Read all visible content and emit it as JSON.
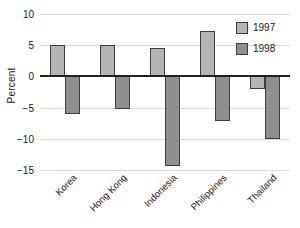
{
  "chart_data": {
    "type": "bar",
    "title": "",
    "xlabel": "",
    "ylabel": "Percent",
    "categories": [
      "Korea",
      "Hong Kong",
      "Indonesia",
      "Philippines",
      "Thailand"
    ],
    "series": [
      {
        "name": "1997",
        "color": "#b4b4b4",
        "values": [
          5.0,
          5.1,
          4.5,
          7.3,
          -2.0
        ]
      },
      {
        "name": "1998",
        "color": "#8f8f8f",
        "values": [
          -6.1,
          -5.2,
          -14.3,
          -7.2,
          -10.0
        ]
      }
    ],
    "ylim": [
      -15,
      10
    ],
    "yticks": [
      10,
      5,
      0,
      -5,
      -10,
      -15
    ],
    "ytick_labels": [
      "10",
      "5",
      "0",
      "−5",
      "−10",
      "−15"
    ],
    "grid": true,
    "zero_line": true,
    "legend_position": "top-right",
    "legend_entries": [
      "1997",
      "1998"
    ],
    "xtick_rotation": 45
  },
  "colors": {
    "series_1997": "#b4b4b4",
    "series_1998": "#8f8f8f",
    "bar_outline": "#3d3d3d",
    "gridline": "#d9d9d9",
    "zero_line": "#1f1f1f",
    "text": "#1a1a1a",
    "background": "#ffffff"
  }
}
